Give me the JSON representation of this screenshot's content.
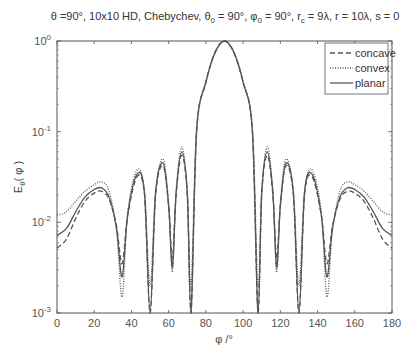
{
  "chart_data": {
    "type": "line",
    "title": "θ =90°, 10x10 HD, Chebychev, θ0 = 90°, φ0 = 90°, rc = 9λ, r = 10λ, s = 0",
    "title_parts": {
      "a": "θ =90°, 10x10 HD, Chebychev, θ",
      "a_sub": "0",
      "b": " = 90°, φ",
      "b_sub": "0",
      "c": " = 90°, r",
      "c_sub": "c",
      "d": " = 9λ, r = 10λ, s = 0"
    },
    "xlabel": "φ /°",
    "ylabel_main": "E",
    "ylabel_sub": "θ",
    "ylabel_tail": "( φ )",
    "xlim": [
      0,
      180
    ],
    "ylim": [
      0.001,
      1
    ],
    "yscale": "log",
    "xticks": [
      0,
      20,
      40,
      60,
      80,
      100,
      120,
      140,
      160,
      180
    ],
    "yticks": [
      {
        "base": "10",
        "exp": "0"
      },
      {
        "base": "10",
        "exp": "-1"
      },
      {
        "base": "10",
        "exp": "-2"
      },
      {
        "base": "10",
        "exp": "-3"
      }
    ],
    "legend": {
      "position": "upper right",
      "entries": [
        {
          "label": "concave",
          "style": "dashed"
        },
        {
          "label": "convex",
          "style": "dotted"
        },
        {
          "label": "planar",
          "style": "solid"
        }
      ]
    },
    "series": [
      {
        "name": "concave",
        "style": "dashed",
        "x": [
          0,
          5,
          10,
          15,
          20,
          24,
          28,
          32,
          35,
          38,
          43,
          47,
          50,
          53,
          57,
          60,
          62,
          64,
          67,
          70,
          72,
          75,
          80,
          85,
          90,
          95,
          100,
          105,
          108,
          110,
          113,
          116,
          118,
          120,
          123,
          127,
          130,
          133,
          137,
          142,
          145,
          148,
          152,
          156,
          160,
          165,
          170,
          175,
          180
        ],
        "values": [
          0.0052,
          0.0065,
          0.011,
          0.017,
          0.021,
          0.022,
          0.018,
          0.009,
          0.0035,
          0.012,
          0.032,
          0.02,
          0.001,
          0.02,
          0.042,
          0.015,
          0.004,
          0.02,
          0.055,
          0.02,
          0.001,
          0.1,
          0.35,
          0.75,
          1.0,
          0.75,
          0.35,
          0.1,
          0.001,
          0.02,
          0.055,
          0.02,
          0.004,
          0.015,
          0.042,
          0.02,
          0.001,
          0.02,
          0.032,
          0.012,
          0.0035,
          0.009,
          0.018,
          0.022,
          0.021,
          0.017,
          0.011,
          0.0065,
          0.0052
        ]
      },
      {
        "name": "convex",
        "style": "dotted",
        "x": [
          0,
          5,
          10,
          15,
          20,
          24,
          28,
          32,
          35,
          38,
          43,
          47,
          50,
          53,
          57,
          60,
          62,
          64,
          67,
          70,
          72,
          75,
          80,
          85,
          90,
          95,
          100,
          105,
          108,
          110,
          113,
          116,
          118,
          120,
          123,
          127,
          130,
          133,
          137,
          142,
          145,
          148,
          152,
          156,
          160,
          165,
          170,
          175,
          180
        ],
        "values": [
          0.012,
          0.013,
          0.017,
          0.022,
          0.026,
          0.028,
          0.022,
          0.008,
          0.0015,
          0.013,
          0.038,
          0.022,
          0.002,
          0.022,
          0.05,
          0.016,
          0.0028,
          0.022,
          0.068,
          0.022,
          0.002,
          0.11,
          0.36,
          0.76,
          1.0,
          0.76,
          0.36,
          0.11,
          0.002,
          0.022,
          0.068,
          0.022,
          0.0028,
          0.016,
          0.05,
          0.022,
          0.002,
          0.022,
          0.038,
          0.013,
          0.0015,
          0.008,
          0.022,
          0.028,
          0.026,
          0.022,
          0.017,
          0.013,
          0.012
        ]
      },
      {
        "name": "planar",
        "style": "solid",
        "x": [
          0,
          5,
          10,
          15,
          20,
          24,
          28,
          32,
          35,
          38,
          43,
          47,
          50,
          53,
          57,
          60,
          62,
          64,
          67,
          70,
          72,
          75,
          80,
          85,
          90,
          95,
          100,
          105,
          108,
          110,
          113,
          116,
          118,
          120,
          123,
          127,
          130,
          133,
          137,
          142,
          145,
          148,
          152,
          156,
          160,
          165,
          170,
          175,
          180
        ],
        "values": [
          0.0072,
          0.0085,
          0.013,
          0.019,
          0.023,
          0.024,
          0.019,
          0.0085,
          0.0025,
          0.012,
          0.034,
          0.021,
          0.001,
          0.021,
          0.045,
          0.015,
          0.0032,
          0.021,
          0.06,
          0.021,
          0.001,
          0.1,
          0.35,
          0.75,
          1.0,
          0.75,
          0.35,
          0.1,
          0.001,
          0.021,
          0.06,
          0.021,
          0.0032,
          0.015,
          0.045,
          0.021,
          0.001,
          0.021,
          0.034,
          0.012,
          0.0025,
          0.0085,
          0.019,
          0.024,
          0.023,
          0.019,
          0.013,
          0.0085,
          0.0072
        ]
      }
    ]
  },
  "colors": {
    "axis": "#555555",
    "line": "#555555",
    "text": "#444444",
    "background": "#ffffff"
  }
}
